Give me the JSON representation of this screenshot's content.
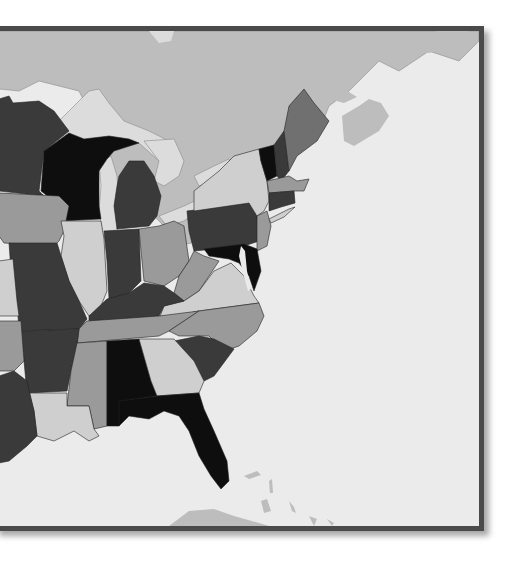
{
  "map": {
    "region": "Eastern United States",
    "style": "grayscale political map",
    "colors": {
      "frame": "#4a4a4a",
      "water": "#ebebeb",
      "canada": "#bdbdbd",
      "lakes": "#dcdcdc",
      "black": "#0e0e0e",
      "dark": "#3a3a3a",
      "mid": "#707070",
      "light": "#9a9a9a",
      "pale": "#cfcfcf"
    },
    "states": [
      {
        "name": "Minnesota",
        "shade": "dark"
      },
      {
        "name": "Wisconsin",
        "shade": "black"
      },
      {
        "name": "Michigan",
        "shade": "dark"
      },
      {
        "name": "Iowa",
        "shade": "light"
      },
      {
        "name": "Illinois",
        "shade": "pale"
      },
      {
        "name": "Indiana",
        "shade": "dark"
      },
      {
        "name": "Ohio",
        "shade": "light"
      },
      {
        "name": "Pennsylvania",
        "shade": "dark"
      },
      {
        "name": "New York",
        "shade": "pale"
      },
      {
        "name": "Vermont",
        "shade": "black"
      },
      {
        "name": "New Hampshire",
        "shade": "dark"
      },
      {
        "name": "Maine",
        "shade": "mid"
      },
      {
        "name": "Massachusetts",
        "shade": "light"
      },
      {
        "name": "Connecticut",
        "shade": "dark"
      },
      {
        "name": "New Jersey",
        "shade": "light"
      },
      {
        "name": "Maryland",
        "shade": "black"
      },
      {
        "name": "West Virginia",
        "shade": "light"
      },
      {
        "name": "Virginia",
        "shade": "pale"
      },
      {
        "name": "Kentucky",
        "shade": "dark"
      },
      {
        "name": "Missouri",
        "shade": "dark"
      },
      {
        "name": "Tennessee",
        "shade": "light"
      },
      {
        "name": "North Carolina",
        "shade": "light"
      },
      {
        "name": "South Carolina",
        "shade": "dark"
      },
      {
        "name": "Arkansas",
        "shade": "dark"
      },
      {
        "name": "Mississippi",
        "shade": "light"
      },
      {
        "name": "Alabama",
        "shade": "black"
      },
      {
        "name": "Georgia",
        "shade": "pale"
      },
      {
        "name": "Florida",
        "shade": "black"
      },
      {
        "name": "Louisiana",
        "shade": "pale"
      },
      {
        "name": "Texas",
        "shade": "dark"
      },
      {
        "name": "Oklahoma",
        "shade": "light"
      },
      {
        "name": "Kansas",
        "shade": "pale"
      }
    ]
  }
}
